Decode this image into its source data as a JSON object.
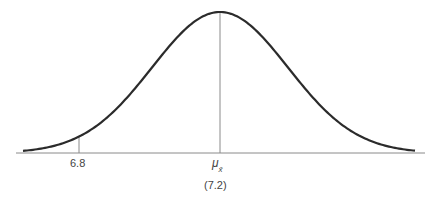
{
  "chart_data": {
    "type": "line",
    "title": "",
    "xlabel": "",
    "ylabel": "",
    "distribution": {
      "family": "normal",
      "mean": 7.2,
      "mean_label": "μx̄"
    },
    "ticks": [
      {
        "label": "6.8",
        "value": 6.8
      },
      {
        "label": "μx̄",
        "value": 7.2,
        "sublabel": "(7.2)"
      }
    ],
    "reference_lines": [
      {
        "x": 7.2,
        "to": "peak"
      },
      {
        "x": 6.8,
        "to": "curve"
      }
    ],
    "grid": false,
    "legend": "none"
  },
  "labels": {
    "tick_6_8": "6.8",
    "mu": "μ",
    "mu_sub": "x̄",
    "mean_value": "(7.2)"
  },
  "colors": {
    "curve": "#2b2b2b",
    "axis": "#888888",
    "ref_line": "#888888"
  }
}
